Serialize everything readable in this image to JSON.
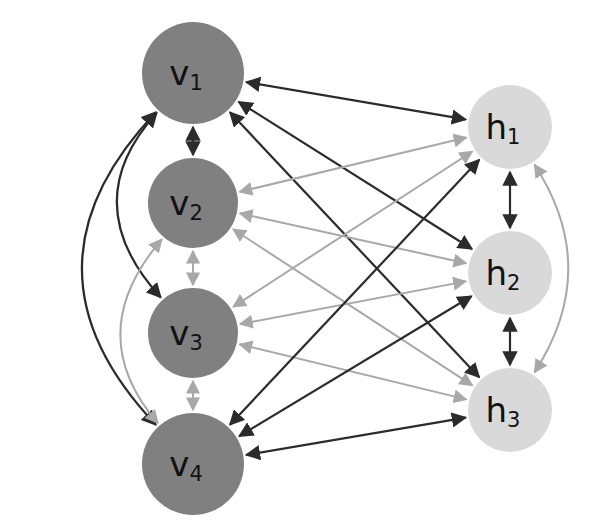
{
  "diagram": {
    "background_color": "#ffffff",
    "colors": {
      "visible_node_fill": "#808080",
      "hidden_node_fill": "#d9d9d9",
      "label_color": "#111111",
      "edge_dark": "#2b2b2b",
      "edge_light": "#a8a8a8"
    },
    "layers": [
      {
        "name": "visible-layer",
        "prefix": "v",
        "fill": "#808080",
        "nodes": [
          {
            "id": "v1",
            "label": "v",
            "sub": "1",
            "cx": 193,
            "cy": 73,
            "r": 51
          },
          {
            "id": "v2",
            "label": "v",
            "sub": "2",
            "cx": 193,
            "cy": 203,
            "r": 45
          },
          {
            "id": "v3",
            "label": "v",
            "sub": "3",
            "cx": 193,
            "cy": 333,
            "r": 45
          },
          {
            "id": "v4",
            "label": "v",
            "sub": "4",
            "cx": 193,
            "cy": 464,
            "r": 51
          }
        ]
      },
      {
        "name": "hidden-layer",
        "prefix": "h",
        "fill": "#d9d9d9",
        "nodes": [
          {
            "id": "h1",
            "label": "h",
            "sub": "1",
            "cx": 510,
            "cy": 127,
            "r": 42
          },
          {
            "id": "h2",
            "label": "h",
            "sub": "2",
            "cx": 510,
            "cy": 273,
            "r": 42
          },
          {
            "id": "h3",
            "label": "h",
            "sub": "3",
            "cx": 510,
            "cy": 410,
            "r": 42
          }
        ]
      }
    ],
    "edges": {
      "intra_visible_vertical": [
        {
          "id": "v1-v2",
          "from": "v1",
          "to": "v2",
          "color": "dark",
          "bidirectional": true
        },
        {
          "id": "v2-v3",
          "from": "v2",
          "to": "v3",
          "color": "light",
          "bidirectional": true
        },
        {
          "id": "v3-v4",
          "from": "v3",
          "to": "v4",
          "color": "light",
          "bidirectional": true
        }
      ],
      "intra_visible_curved": [
        {
          "id": "v1-v3",
          "from": "v1",
          "to": "v3",
          "color": "dark",
          "bidirectional": true,
          "bulge": 118
        },
        {
          "id": "v1-v4",
          "from": "v1",
          "to": "v4",
          "color": "dark",
          "bidirectional": true,
          "bulge": 185
        },
        {
          "id": "v2-v4",
          "from": "v2",
          "to": "v4",
          "color": "light",
          "bidirectional": true,
          "bulge": 112
        }
      ],
      "intra_hidden_vertical": [
        {
          "id": "h1-h2",
          "from": "h1",
          "to": "h2",
          "color": "dark",
          "bidirectional": true
        },
        {
          "id": "h2-h3",
          "from": "h2",
          "to": "h3",
          "color": "dark",
          "bidirectional": true
        }
      ],
      "intra_hidden_curved": [
        {
          "id": "h1-h3",
          "from": "h1",
          "to": "h3",
          "color": "light",
          "bidirectional": true,
          "bulge": 92
        }
      ],
      "inter_layer": [
        {
          "id": "v1-h1",
          "from": "v1",
          "to": "h1",
          "color": "dark",
          "bidirectional": true
        },
        {
          "id": "v1-h2",
          "from": "v1",
          "to": "h2",
          "color": "dark",
          "bidirectional": true
        },
        {
          "id": "v1-h3",
          "from": "v1",
          "to": "h3",
          "color": "dark",
          "bidirectional": true
        },
        {
          "id": "v2-h1",
          "from": "v2",
          "to": "h1",
          "color": "light",
          "bidirectional": true
        },
        {
          "id": "v2-h2",
          "from": "v2",
          "to": "h2",
          "color": "light",
          "bidirectional": true
        },
        {
          "id": "v2-h3",
          "from": "v2",
          "to": "h3",
          "color": "light",
          "bidirectional": true
        },
        {
          "id": "v3-h1",
          "from": "v3",
          "to": "h1",
          "color": "light",
          "bidirectional": true
        },
        {
          "id": "v3-h2",
          "from": "v3",
          "to": "h2",
          "color": "light",
          "bidirectional": true
        },
        {
          "id": "v3-h3",
          "from": "v3",
          "to": "h3",
          "color": "light",
          "bidirectional": true
        },
        {
          "id": "v4-h1",
          "from": "v4",
          "to": "h1",
          "color": "dark",
          "bidirectional": true
        },
        {
          "id": "v4-h2",
          "from": "v4",
          "to": "h2",
          "color": "dark",
          "bidirectional": true
        },
        {
          "id": "v4-h3",
          "from": "v4",
          "to": "h3",
          "color": "dark",
          "bidirectional": true
        }
      ]
    },
    "counts": {
      "visible_nodes": 4,
      "hidden_nodes": 3,
      "total_edges": 21
    }
  }
}
